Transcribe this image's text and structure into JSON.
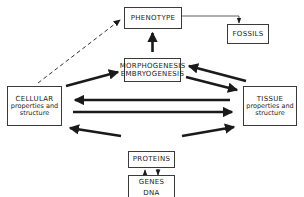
{
  "diagram": {
    "nodes": {
      "phenotype": {
        "label": "PHENOTYPE"
      },
      "fossils": {
        "label": "FOSSILS"
      },
      "morphogenesis": {
        "line1": "MORPHOGENESIS",
        "line2": "EMBRYOGENESIS"
      },
      "cellular": {
        "line1": "CELLULAR",
        "line2": "properties and",
        "line3": "structure"
      },
      "tissue": {
        "line1": "TISSUE",
        "line2": "properties and",
        "line3": "structure"
      },
      "proteins": {
        "label": "PROTEINS"
      },
      "genes": {
        "line1": "GENES",
        "line2": "DNA"
      }
    },
    "edges": [
      {
        "from": "cellular",
        "to": "phenotype",
        "style": "dashed"
      },
      {
        "from": "phenotype",
        "to": "fossils",
        "style": "thin"
      },
      {
        "from": "morphogenesis",
        "to": "phenotype",
        "style": "thick"
      },
      {
        "from": "cellular",
        "to": "morphogenesis",
        "style": "thick"
      },
      {
        "from": "tissue",
        "to": "morphogenesis",
        "style": "thick"
      },
      {
        "from": "morphogenesis",
        "to": "tissue",
        "style": "thick"
      },
      {
        "from": "tissue",
        "to": "cellular",
        "style": "thick"
      },
      {
        "from": "cellular",
        "to": "tissue",
        "style": "thick"
      },
      {
        "from": "proteins",
        "to": "cellular",
        "style": "thick"
      },
      {
        "from": "proteins",
        "to": "tissue",
        "style": "thick"
      },
      {
        "from": "genes",
        "to": "proteins",
        "style": "thin"
      },
      {
        "from": "proteins",
        "to": "genes",
        "style": "thin"
      }
    ],
    "colors": {
      "line": "#1a1a1a",
      "background": "#ffffff"
    }
  }
}
